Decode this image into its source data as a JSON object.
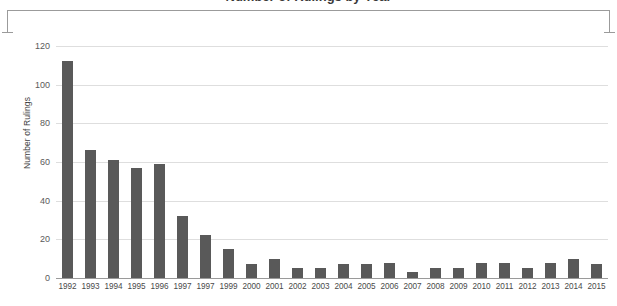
{
  "chart_data": {
    "type": "bar",
    "title": "Number of Rulings by Year",
    "xlabel": "",
    "ylabel": "Number of Rulings",
    "ylim": [
      0,
      120
    ],
    "yticks": [
      0,
      20,
      40,
      60,
      80,
      100,
      120
    ],
    "grid": true,
    "legend": "none",
    "bar_color": "#595959",
    "categories": [
      "1992",
      "1993",
      "1994",
      "1995",
      "1996",
      "1997",
      "1997",
      "1999",
      "2000",
      "2001",
      "2002",
      "2003",
      "2004",
      "2005",
      "2006",
      "2007",
      "2008",
      "2009",
      "2010",
      "2011",
      "2012",
      "2013",
      "2014",
      "2015"
    ],
    "values": [
      112,
      66,
      61,
      57,
      59,
      32,
      22,
      15,
      7,
      10,
      5,
      5,
      7,
      7,
      8,
      3,
      5,
      5,
      8,
      8,
      5,
      8,
      10,
      7
    ]
  },
  "annotation": {
    "bracket": "top-span-bracket"
  }
}
